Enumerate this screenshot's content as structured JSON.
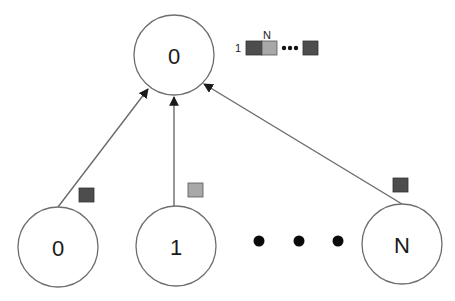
{
  "diagram": {
    "root": {
      "label": "0",
      "cx": 174,
      "cy": 55,
      "r": 40
    },
    "children": [
      {
        "label": "0",
        "cx": 58,
        "cy": 247,
        "r": 40,
        "packet_color": "#4d4d4d"
      },
      {
        "label": "1",
        "cx": 176,
        "cy": 246,
        "r": 40,
        "packet_color": "#a8a8a8"
      },
      {
        "label": "N",
        "cx": 402,
        "cy": 244,
        "r": 40,
        "packet_color": "#4d4d4d"
      }
    ],
    "ellipsis_dots": 3,
    "legend": {
      "start_label": "1",
      "top_label": "N",
      "cells": [
        "#4d4d4d",
        "#a8a8a8",
        "#4d4d4d"
      ],
      "ellipsis": "•••"
    },
    "colors": {
      "dark_packet": "#4d4d4d",
      "light_packet": "#a8a8a8",
      "edge": "#6a6a6a",
      "node_stroke": "#6e6e6e"
    }
  }
}
